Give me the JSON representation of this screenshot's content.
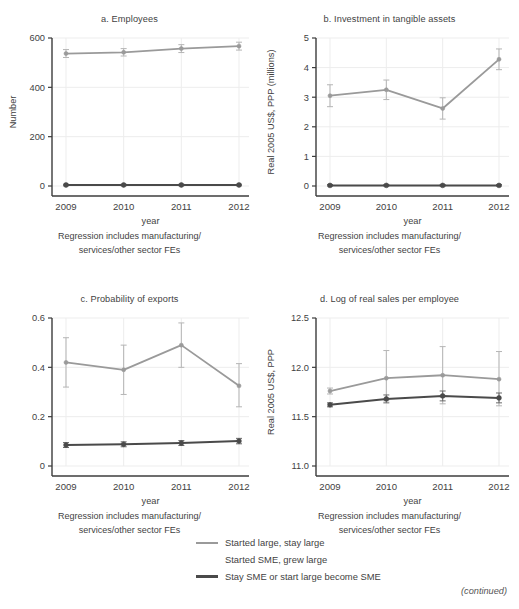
{
  "figure": {
    "continued_note": "(continued)",
    "caption_line1": "Regression includes manufacturing/",
    "caption_line2": "services/other sector FEs",
    "xlabel": "year"
  },
  "legend": {
    "position": "bottom-center",
    "items": [
      {
        "label": "Started large, stay large",
        "color": "#9a9a9a",
        "style": "line"
      },
      {
        "label": "Started SME, grew large",
        "color": "#ffffff",
        "style": "none"
      },
      {
        "label": "Stay SME or start large become SME",
        "color": "#4a4a4a",
        "style": "line-thick"
      }
    ]
  },
  "colors": {
    "series_started_large": "#9a9a9a",
    "series_started_sme_grew_large": "#ffffff",
    "series_stay_sme": "#4a4a4a",
    "axis": "#3c3c3c",
    "grid": "#ededed",
    "text": "#3f3f3f"
  },
  "chart_data": [
    {
      "id": "a",
      "type": "line",
      "title": "a. Employees",
      "xlabel": "year",
      "ylabel": "Number",
      "categories": [
        "2009",
        "2010",
        "2011",
        "2012"
      ],
      "x": [
        2009,
        2010,
        2011,
        2012
      ],
      "ylim": [
        0,
        600
      ],
      "yticks": [
        0,
        200,
        400,
        600
      ],
      "ytick_labels": [
        "0",
        "200",
        "400",
        "600"
      ],
      "grid": true,
      "series": [
        {
          "name": "Started large, stay large",
          "color": "#9a9a9a",
          "values": [
            537,
            542,
            557,
            567
          ],
          "err_low": [
            521,
            527,
            541,
            551
          ],
          "err_high": [
            553,
            557,
            573,
            583
          ]
        },
        {
          "name": "Stay SME or start large become SME",
          "color": "#4a4a4a",
          "values": [
            4,
            4,
            4,
            4
          ],
          "err_low": [
            1,
            1,
            1,
            1
          ],
          "err_high": [
            7,
            7,
            7,
            7
          ]
        }
      ]
    },
    {
      "id": "b",
      "type": "line",
      "title": "b. Investment in tangible assets",
      "xlabel": "year",
      "ylabel": "Real 2005 US$, PPP (millions)",
      "categories": [
        "2009",
        "2010",
        "2011",
        "2012"
      ],
      "x": [
        2009,
        2010,
        2011,
        2012
      ],
      "ylim": [
        0,
        5
      ],
      "yticks": [
        0,
        1,
        2,
        3,
        4,
        5
      ],
      "ytick_labels": [
        "0",
        "1",
        "2",
        "3",
        "4",
        "5"
      ],
      "grid": true,
      "series": [
        {
          "name": "Started large, stay large",
          "color": "#9a9a9a",
          "values": [
            3.05,
            3.25,
            2.62,
            4.28
          ],
          "err_low": [
            2.68,
            2.92,
            2.26,
            3.93
          ],
          "err_high": [
            3.42,
            3.58,
            2.98,
            4.63
          ]
        },
        {
          "name": "Stay SME or start large become SME",
          "color": "#4a4a4a",
          "values": [
            0.02,
            0.02,
            0.02,
            0.02
          ],
          "err_low": [
            0.0,
            0.0,
            0.0,
            0.0
          ],
          "err_high": [
            0.05,
            0.05,
            0.05,
            0.05
          ]
        }
      ]
    },
    {
      "id": "c",
      "type": "line",
      "title": "c. Probability of exports",
      "xlabel": "year",
      "ylabel": "",
      "categories": [
        "2009",
        "2010",
        "2011",
        "2012"
      ],
      "x": [
        2009,
        2010,
        2011,
        2012
      ],
      "ylim": [
        0,
        0.6
      ],
      "yticks": [
        0,
        0.2,
        0.4,
        0.6
      ],
      "ytick_labels": [
        "0",
        "0.2",
        "0.4",
        "0.6"
      ],
      "grid": true,
      "series": [
        {
          "name": "Started large, stay large",
          "color": "#9a9a9a",
          "values": [
            0.42,
            0.39,
            0.49,
            0.325
          ],
          "err_low": [
            0.32,
            0.29,
            0.4,
            0.24
          ],
          "err_high": [
            0.52,
            0.49,
            0.58,
            0.415
          ]
        },
        {
          "name": "Stay SME or start large become SME",
          "color": "#4a4a4a",
          "values": [
            0.085,
            0.088,
            0.093,
            0.101
          ],
          "err_low": [
            0.075,
            0.078,
            0.083,
            0.09
          ],
          "err_high": [
            0.095,
            0.098,
            0.103,
            0.112
          ]
        }
      ]
    },
    {
      "id": "d",
      "type": "line",
      "title": "d. Log of real sales per employee",
      "xlabel": "year",
      "ylabel": "Real 2005 US$, PPP",
      "categories": [
        "2009",
        "2010",
        "2011",
        "2012"
      ],
      "x": [
        2009,
        2010,
        2011,
        2012
      ],
      "ylim": [
        11.0,
        12.5
      ],
      "yticks": [
        11.0,
        11.5,
        12.0,
        12.5
      ],
      "ytick_labels": [
        "11.0",
        "11.5",
        "12.0",
        "12.5"
      ],
      "grid": true,
      "series": [
        {
          "name": "Started large, stay large",
          "color": "#9a9a9a",
          "values": [
            11.76,
            11.89,
            11.92,
            11.88
          ],
          "err_low": [
            11.73,
            11.66,
            11.63,
            11.61
          ],
          "err_high": [
            11.79,
            12.17,
            12.21,
            12.16
          ]
        },
        {
          "name": "Stay SME or start large become SME",
          "color": "#4a4a4a",
          "values": [
            11.62,
            11.68,
            11.71,
            11.69
          ],
          "err_low": [
            11.6,
            11.64,
            11.66,
            11.64
          ],
          "err_high": [
            11.64,
            11.72,
            11.76,
            11.74
          ]
        }
      ]
    }
  ]
}
